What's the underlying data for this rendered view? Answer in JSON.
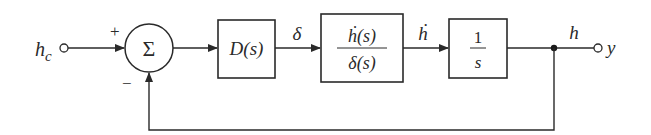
{
  "diagram": {
    "type": "feedback-control-block-diagram",
    "input": {
      "label": "h",
      "subscript": "c"
    },
    "summing_junction": {
      "symbol": "Σ",
      "plus_sign": "+",
      "minus_sign": "−"
    },
    "blocks": [
      {
        "id": "controller",
        "label": "D(s)"
      },
      {
        "id": "plant",
        "numerator": "ḣ(s)",
        "denominator": "δ(s)"
      },
      {
        "id": "integrator",
        "numerator": "1",
        "denominator": "s"
      }
    ],
    "signals": {
      "controller_out": "δ",
      "plant_out": "ḣ",
      "integrator_out": "h"
    },
    "output": {
      "label": "y"
    }
  }
}
